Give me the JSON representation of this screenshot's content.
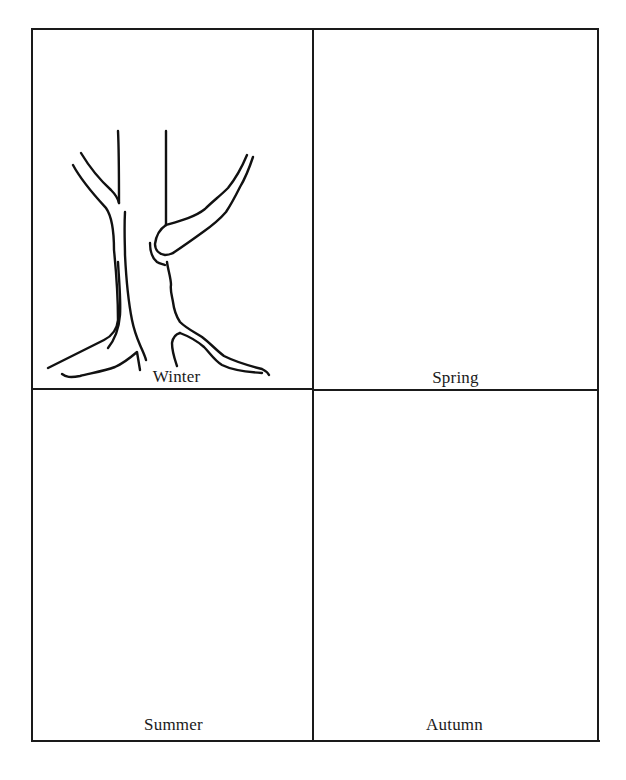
{
  "worksheet": {
    "layout": "2x2 grid",
    "cells": [
      {
        "season": "Winter",
        "position": "top-left",
        "drawing": "bare-tree"
      },
      {
        "season": "Spring",
        "position": "top-right",
        "drawing": ""
      },
      {
        "season": "Summer",
        "position": "bottom-left",
        "drawing": ""
      },
      {
        "season": "Autumn",
        "position": "bottom-right",
        "drawing": ""
      }
    ],
    "colors": {
      "ink": "#1a1a1a",
      "background": "#ffffff"
    }
  }
}
